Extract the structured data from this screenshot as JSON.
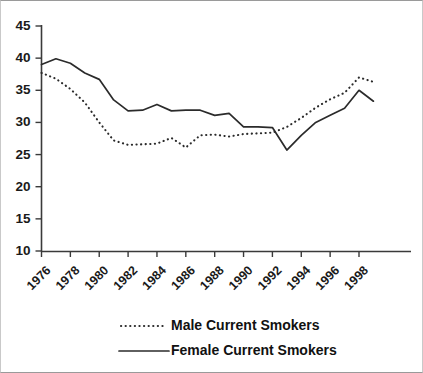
{
  "chart_data": {
    "type": "line",
    "title": "",
    "subtitle": "",
    "xlabel": "",
    "ylabel": "",
    "xlim": [
      1976,
      1999
    ],
    "ylim": [
      10,
      45
    ],
    "grid": false,
    "legend_position": "bottom",
    "y_ticks": [
      45,
      40,
      35,
      30,
      25,
      20,
      15,
      10
    ],
    "x_ticks": [
      1976,
      1978,
      1980,
      1982,
      1984,
      1986,
      1988,
      1990,
      1992,
      1994,
      1996,
      1998
    ],
    "x": [
      1976,
      1977,
      1978,
      1979,
      1980,
      1981,
      1982,
      1983,
      1984,
      1985,
      1986,
      1987,
      1988,
      1989,
      1990,
      1991,
      1992,
      1993,
      1994,
      1995,
      1996,
      1997,
      1998,
      1999
    ],
    "series": [
      {
        "name": "Male Current Smokers",
        "style": "dotted",
        "color": "#2b2b2b",
        "values": [
          37.7,
          36.8,
          35.2,
          33.1,
          30.0,
          27.2,
          26.5,
          26.6,
          26.7,
          27.6,
          26.1,
          28.0,
          28.1,
          27.8,
          28.2,
          28.3,
          28.4,
          29.3,
          30.7,
          32.3,
          33.6,
          34.6,
          37.0,
          36.3
        ]
      },
      {
        "name": "Female Current Smokers",
        "style": "solid",
        "color": "#2b2b2b",
        "values": [
          39.0,
          39.9,
          39.2,
          37.7,
          36.7,
          33.5,
          31.8,
          31.9,
          32.8,
          31.8,
          31.9,
          31.9,
          31.1,
          31.4,
          29.3,
          29.3,
          29.2,
          25.7,
          28.0,
          30.0,
          31.1,
          32.2,
          35.0,
          33.3
        ]
      }
    ]
  },
  "axes": {
    "y_labels": [
      "45",
      "40",
      "35",
      "30",
      "25",
      "20",
      "15",
      "10"
    ],
    "x_labels": [
      "1976",
      "1978",
      "1980",
      "1982",
      "1984",
      "1986",
      "1988",
      "1990",
      "1992",
      "1994",
      "1996",
      "1998"
    ]
  },
  "legend": {
    "items": [
      {
        "label": "Male Current Smokers",
        "style": "dotted"
      },
      {
        "label": "Female Current Smokers",
        "style": "solid"
      }
    ]
  }
}
